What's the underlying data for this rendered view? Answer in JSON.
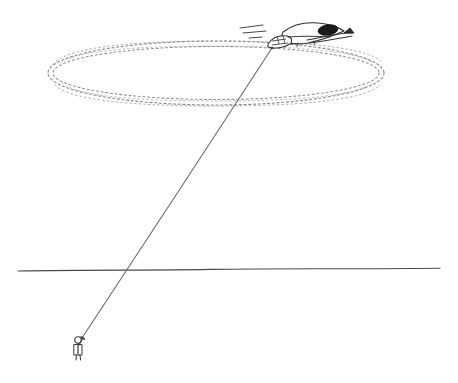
{
  "illustration": {
    "title": "Control-line model aircraft circling on a tether",
    "kind": "hand-drawn line sketch",
    "background_color": "#ffffff",
    "ink_color": "#3a3a3a",
    "faint_ink_color": "#8d8d8d",
    "canvas": {
      "width": 458,
      "height": 383
    }
  },
  "flight_path": {
    "label": "dotted oval flight path",
    "shape": "ellipse",
    "stroke_style": "dotted",
    "stroke_color": "#8d8d8d",
    "band_lines": 2,
    "center_x": 216,
    "center_y": 73,
    "radius_x": 168,
    "radius_y": 30,
    "band_offset": 5,
    "left_edge_x": 48,
    "right_edge_x": 385,
    "top_edge_y": 41,
    "bottom_edge_y": 106
  },
  "aircraft": {
    "label": "model airplane",
    "position_x": 300,
    "position_y": 34,
    "heading": "left",
    "body_color": "#2e2e2e",
    "wing_fill": "#ffffff",
    "tail_shade_color": "#1a1a1a",
    "tether_attach_x": 272,
    "tether_attach_y": 48,
    "speed_lines": 3,
    "speed_lines_x": 240,
    "speed_lines_y": 28
  },
  "control_line": {
    "label": "control line tether",
    "stroke_color": "#6f6f6f",
    "from_x": 82,
    "from_y": 338,
    "to_x": 272,
    "to_y": 48
  },
  "pilot": {
    "label": "person holding control handle",
    "position_x": 79,
    "position_y": 346,
    "height": 24,
    "ink_color": "#3a3a3a"
  },
  "horizon": {
    "label": "ground horizon line",
    "stroke_color": "#4a4a4a",
    "left_x": 18,
    "right_x": 440,
    "y": 270
  }
}
